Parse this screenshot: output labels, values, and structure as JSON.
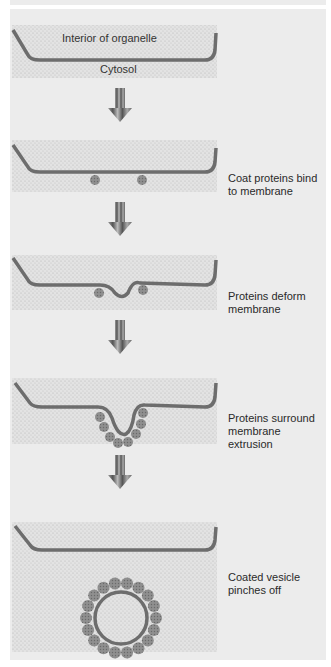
{
  "figure": {
    "title_labels": {
      "interior": "Interior of organelle",
      "cytosol": "Cytosol"
    },
    "steps": [
      {
        "label": "Coat proteins bind to membrane",
        "lines": [
          "Coat proteins bind",
          "to membrane"
        ]
      },
      {
        "label": "Proteins deform membrane",
        "lines": [
          "Proteins deform",
          "membrane"
        ]
      },
      {
        "label": "Proteins surround membrane extrusion",
        "lines": [
          "Proteins surround",
          "membrane",
          "extrusion"
        ]
      },
      {
        "label": "Coated vesicle pinches off",
        "lines": [
          "Coated vesicle",
          "pinches off"
        ]
      }
    ],
    "colors": {
      "panel": "#ececec",
      "stipple": "#d9d9d9",
      "membrane": "#6d6d6d",
      "protein": "#8a8a8a",
      "arrow": "#7a7a7a"
    },
    "icons": [
      "down-arrow-icon",
      "coat-protein-icon",
      "vesicle-icon"
    ]
  }
}
